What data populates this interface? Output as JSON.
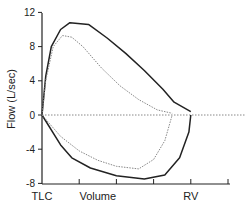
{
  "chart_data": {
    "type": "line",
    "title": "",
    "xlabel": "Volume",
    "ylabel": "Flow (L/sec)",
    "ylim": [
      -8,
      12
    ],
    "yticks": [
      12,
      8,
      4,
      0,
      -4,
      -8
    ],
    "xlim": [
      0,
      5
    ],
    "xtick_positions": [
      0,
      1,
      2,
      3,
      4,
      5
    ],
    "x_annotations": [
      {
        "label": "TLC",
        "x": 0
      },
      {
        "label": "Volume",
        "x": 1.5
      },
      {
        "label": "RV",
        "x": 4
      }
    ],
    "grid": false,
    "legend": null,
    "reference_line": {
      "y": 0,
      "style": "dotted",
      "from_x": 0,
      "to_x": 5.3
    },
    "series": [
      {
        "name": "normal-loop",
        "style": "solid",
        "color": "#222222",
        "expiratory": {
          "x": [
            0,
            0.1,
            0.25,
            0.5,
            0.75,
            1.25,
            1.75,
            2.25,
            2.75,
            3.25,
            3.55,
            4.0
          ],
          "y": [
            0,
            4.5,
            8,
            10,
            10.8,
            10.6,
            9,
            7.2,
            5.2,
            3.0,
            1.5,
            0.4
          ]
        },
        "inspiratory": {
          "x": [
            0,
            0.5,
            0.8,
            1.3,
            2.0,
            2.75,
            3.3,
            3.7,
            3.95,
            4.0
          ],
          "y": [
            0,
            -3.5,
            -5,
            -6.2,
            -7.1,
            -7.5,
            -7.0,
            -5.0,
            -2.0,
            0
          ]
        }
      },
      {
        "name": "comparison-loop",
        "style": "dotted",
        "color": "#888888",
        "expiratory": {
          "x": [
            0,
            0.1,
            0.3,
            0.55,
            0.8,
            1.1,
            1.6,
            2.1,
            2.6,
            3.1,
            3.5
          ],
          "y": [
            0,
            4,
            8,
            9.3,
            9.1,
            8.0,
            5.5,
            3.4,
            1.8,
            0.6,
            0.2
          ]
        },
        "inspiratory": {
          "x": [
            0,
            0.5,
            1.0,
            1.5,
            2.0,
            2.6,
            3.0,
            3.3,
            3.5
          ],
          "y": [
            0,
            -2.5,
            -4.2,
            -5.3,
            -6.0,
            -6.3,
            -5.2,
            -3.0,
            0
          ]
        }
      }
    ]
  }
}
